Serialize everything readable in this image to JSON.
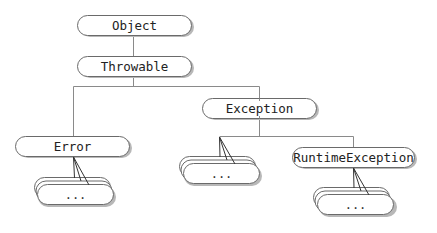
{
  "diagram": {
    "type": "class-hierarchy",
    "nodes": {
      "object": {
        "label": "Object",
        "x": 78,
        "y": 15,
        "w": 114,
        "h": 20
      },
      "throwable": {
        "label": "Throwable",
        "x": 78,
        "y": 56,
        "w": 114,
        "h": 20
      },
      "error": {
        "label": "Error",
        "x": 16,
        "y": 136,
        "w": 114,
        "h": 20
      },
      "exception": {
        "label": "Exception",
        "x": 203,
        "y": 98,
        "w": 114,
        "h": 20
      },
      "runtime_exception": {
        "label": "RuntimeException",
        "x": 293,
        "y": 147,
        "w": 122,
        "h": 20
      }
    },
    "stacks": {
      "error_subclasses": {
        "label": "...",
        "parent": "Error"
      },
      "exception_subclasses": {
        "label": "...",
        "parent": "Exception"
      },
      "runtime_exception_subclasses": {
        "label": "...",
        "parent": "RuntimeException"
      }
    },
    "edges": [
      [
        "Object",
        "Throwable"
      ],
      [
        "Throwable",
        "Error"
      ],
      [
        "Throwable",
        "Exception"
      ],
      [
        "Exception",
        "RuntimeException"
      ],
      [
        "Exception",
        "..."
      ],
      [
        "Error",
        "..."
      ],
      [
        "RuntimeException",
        "..."
      ]
    ],
    "colors": {
      "line": "#8a8a8a",
      "box_stroke": "#6a6a6a",
      "box_fill": "#ffffff",
      "shadow": "#b8b8b8",
      "fan_line": "#333333"
    }
  }
}
